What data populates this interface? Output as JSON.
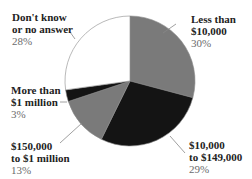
{
  "chart_data": {
    "type": "pie",
    "title": "",
    "start_angle_deg": 0,
    "direction": "clockwise",
    "slices": [
      {
        "label": "Less than $10,000",
        "label_lines": [
          "Less than",
          "$10,000"
        ],
        "value": 30,
        "pct_text": "30%",
        "color": "#7a7a7a"
      },
      {
        "label": "$10,000 to $149,000",
        "label_lines": [
          "$10,000",
          "to $149,000"
        ],
        "value": 29,
        "pct_text": "29%",
        "color": "#141414"
      },
      {
        "label": "$150,000 to $1 million",
        "label_lines": [
          "$150,000",
          "to $1 million"
        ],
        "value": 13,
        "pct_text": "13%",
        "color": "#7a7a7a"
      },
      {
        "label": "More than $1 million",
        "label_lines": [
          "More than",
          "$1 million"
        ],
        "value": 3,
        "pct_text": "3%",
        "color": "#141414"
      },
      {
        "label": "Don't know or no answer",
        "label_lines": [
          "Don't know",
          "or no answer"
        ],
        "value": 28,
        "pct_text": "28%",
        "color": "#ffffff"
      }
    ],
    "legend": "none (direct labels)"
  },
  "labels": {
    "s0": {
      "line1": "Less than",
      "line2": "$10,000",
      "pct": "30%"
    },
    "s1": {
      "line1": "$10,000",
      "line2": "to $149,000",
      "pct": "29%"
    },
    "s2": {
      "line1": "$150,000",
      "line2": "to $1 million",
      "pct": "13%"
    },
    "s3": {
      "line1": "More than",
      "line2": "$1 million",
      "pct": "3%"
    },
    "s4": {
      "line1": "Don't know",
      "line2": "or no answer",
      "pct": "28%"
    }
  }
}
